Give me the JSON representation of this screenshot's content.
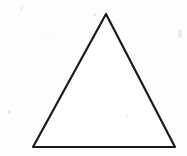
{
  "canvas": {
    "width": 187,
    "height": 156,
    "background_color": "#fdfdfd",
    "paper_tone": "#ffffff"
  },
  "figure": {
    "name": "triangle",
    "shape_type": "triangle",
    "classification": "isosceles",
    "fill": "none",
    "fill_color": "#ffffff",
    "stroke_color": "#1a1a1a",
    "stroke_width": 2.2,
    "stroke_linejoin": "round",
    "stroke_linecap": "round",
    "vertices": [
      {
        "label": "apex",
        "x": 106,
        "y": 14
      },
      {
        "label": "bottom-right",
        "x": 175,
        "y": 147
      },
      {
        "label": "bottom-left",
        "x": 33,
        "y": 147
      }
    ],
    "points_attr": "106,14 175,147 33,147",
    "base_width": 142,
    "height": 133,
    "rendering_style": "scanned-line-drawing"
  },
  "artifacts": {
    "description": "faint scanner speckles on paper background",
    "color": "#d8d8d8",
    "specks": [
      {
        "x": 8,
        "y": 110,
        "w": 3,
        "h": 4,
        "opacity": 0.55
      },
      {
        "x": 178,
        "y": 29,
        "w": 4,
        "h": 9,
        "opacity": 0.5
      },
      {
        "x": 93,
        "y": 13,
        "w": 3,
        "h": 3,
        "opacity": 0.45
      },
      {
        "x": 70,
        "y": 81,
        "w": 2,
        "h": 5,
        "opacity": 0.5
      },
      {
        "x": 126,
        "y": 115,
        "w": 2,
        "h": 3,
        "opacity": 0.4
      },
      {
        "x": 20,
        "y": 6,
        "w": 3,
        "h": 5,
        "opacity": 0.35
      },
      {
        "x": 160,
        "y": 132,
        "w": 2,
        "h": 2,
        "opacity": 0.35
      },
      {
        "x": 47,
        "y": 38,
        "w": 2,
        "h": 2,
        "opacity": 0.3
      }
    ]
  }
}
